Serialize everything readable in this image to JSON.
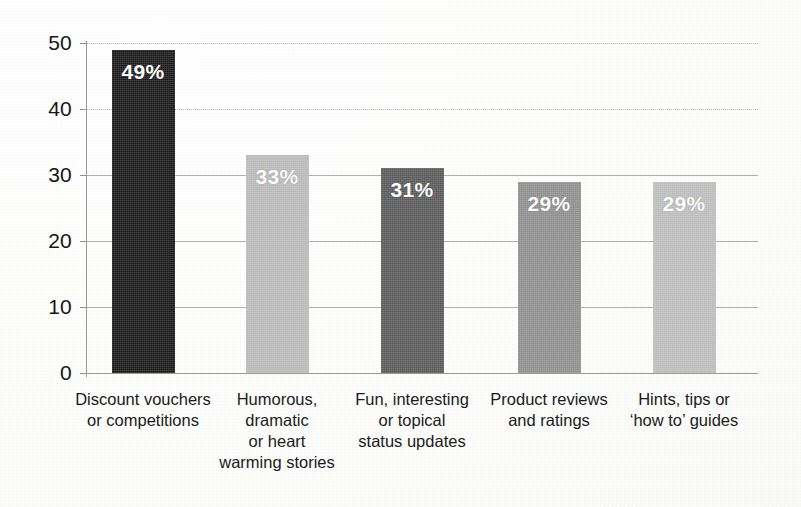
{
  "chart_data": {
    "type": "bar",
    "title": "",
    "subtitle": "",
    "xlabel": "",
    "ylabel": "",
    "ylim": [
      0,
      50
    ],
    "ytick_step": 10,
    "yticks": [
      "50",
      "40",
      "30",
      "20",
      "10",
      "0"
    ],
    "grid": true,
    "legend": "none",
    "categories": [
      "Discount vouchers or competitions",
      "Humorous, dramatic or heart warming stories",
      "Fun, interesting or topical status updates",
      "Product reviews and ratings",
      "Hints, tips or 'how to' guides"
    ],
    "category_lines": [
      [
        "Discount vouchers",
        "or competitions"
      ],
      [
        "Humorous,",
        "dramatic",
        "or heart",
        "warming stories"
      ],
      [
        "Fun, interesting",
        "or topical",
        "status updates"
      ],
      [
        "Product reviews",
        "and ratings"
      ],
      [
        "Hints, tips or",
        "‘how to’ guides"
      ]
    ],
    "values": [
      49,
      33,
      31,
      29,
      29
    ],
    "data_labels": [
      "49%",
      "33%",
      "31%",
      "29%",
      "29%"
    ],
    "bar_colors": [
      "#141414",
      "#b9b9b9",
      "#565656",
      "#8d8d8d",
      "#bcbcbc"
    ],
    "data_label_color": "#ffffff",
    "gridline_color": "#b4b4b4",
    "axis_color": "#9a9a9a",
    "background_color": "#ffffff"
  }
}
